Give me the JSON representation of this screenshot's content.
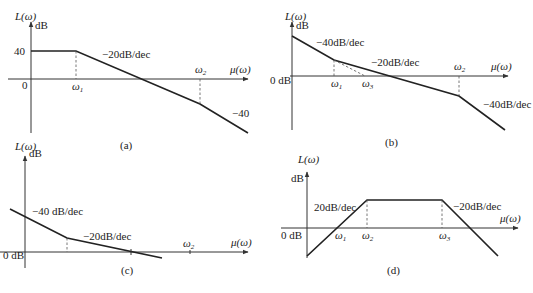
{
  "figure": {
    "panels": [
      {
        "id": "a",
        "caption": "(a)",
        "y_label": "L(ω)",
        "y_unit": "dB",
        "x_label": "μ(ω)",
        "origin_label": "0",
        "level_label": "40",
        "ticks": [
          "ω",
          "ω"
        ],
        "tick_subs": [
          "1",
          "2"
        ],
        "slopes": [
          "−20dB/dec",
          "−40"
        ]
      },
      {
        "id": "b",
        "caption": "(b)",
        "y_label": "L(ω)",
        "y_unit": "dB",
        "x_label": "μ(ω)",
        "origin_label": "0 dB",
        "ticks": [
          "ω",
          "ω",
          "ω"
        ],
        "tick_subs": [
          "1",
          "3",
          "2"
        ],
        "slopes": [
          "−40dB/dec",
          "−20dB/dec",
          "−40dB/dec"
        ]
      },
      {
        "id": "c",
        "caption": "(c)",
        "y_label": "L(ω)",
        "y_unit": "dB",
        "x_label": "μ(ω)",
        "origin_label": "0 dB",
        "ticks": [
          "ω"
        ],
        "tick_subs": [
          "2"
        ],
        "slopes": [
          "−40 dB/dec",
          "−20dB/dec"
        ]
      },
      {
        "id": "d",
        "caption": "(d)",
        "y_label": "L(ω)",
        "y_unit": "dB",
        "x_label": "μ(ω)",
        "origin_label": "0 dB",
        "ticks": [
          "ω",
          "ω",
          "ω"
        ],
        "tick_subs": [
          "1",
          "2",
          "3"
        ],
        "slopes": [
          "20dB/dec",
          "−20dB/dec"
        ]
      }
    ],
    "colors": {
      "line": "#222222",
      "axis": "#333333",
      "background": "#ffffff"
    }
  }
}
